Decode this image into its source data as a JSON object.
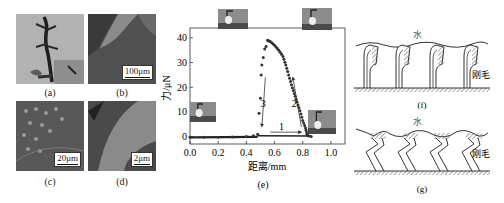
{
  "panels": {
    "a": {
      "caption": "(a)",
      "subject": "gecko-photo"
    },
    "b": {
      "caption": "(b)",
      "scale": "100μm"
    },
    "c": {
      "caption": "(c)",
      "scale": "20μm"
    },
    "d": {
      "caption": "(d)",
      "scale": "2μm"
    },
    "e": {
      "caption": "(e)"
    },
    "f": {
      "caption": "(f)",
      "water_label": "水",
      "bristle_label": "刚毛"
    },
    "g": {
      "caption": "(g)",
      "water_label": "水",
      "bristle_label": "刚毛"
    }
  },
  "colors": {
    "data_points": "#333333",
    "photo_light": "#9a9a9a",
    "photo_dark": "#3a3a3a",
    "hatch": "#555555"
  },
  "chart_data": {
    "type": "scatter",
    "title": "",
    "xlabel": "距离/mm",
    "ylabel": "力/μN",
    "xlim": [
      0.0,
      1.1
    ],
    "ylim": [
      -3,
      44
    ],
    "xticks": [
      "0.0",
      "0.2",
      "0.4",
      "0.6",
      "0.8",
      "1.0"
    ],
    "yticks": [
      "0",
      "10",
      "20",
      "30",
      "40"
    ],
    "grid": false,
    "annotations": [
      {
        "label": "1",
        "x": 0.65,
        "y": 2.5,
        "arrow": "right"
      },
      {
        "label": "2",
        "x": 0.74,
        "y": 12,
        "arrow": "up-left"
      },
      {
        "label": "3",
        "x": 0.52,
        "y": 12,
        "arrow": "down"
      }
    ],
    "series": [
      {
        "name": "force-distance",
        "x": [
          0.0,
          0.1,
          0.2,
          0.3,
          0.4,
          0.45,
          0.48,
          0.49,
          0.5,
          0.505,
          0.51,
          0.52,
          0.53,
          0.54,
          0.55,
          0.57,
          0.6,
          0.63,
          0.66,
          0.68,
          0.7,
          0.72,
          0.74,
          0.76,
          0.78,
          0.8,
          0.82,
          0.83,
          0.84,
          0.86
        ],
        "y": [
          -0.3,
          -0.3,
          -0.3,
          -0.2,
          0.0,
          0.3,
          1.0,
          9.5,
          15.5,
          25.0,
          29.0,
          32.0,
          35.5,
          36.5,
          39.0,
          38.5,
          37.0,
          35.0,
          32.5,
          29.0,
          25.0,
          21.0,
          17.5,
          14.0,
          10.5,
          6.5,
          3.5,
          1.0,
          0.2,
          0.0
        ]
      }
    ],
    "insets": [
      "droplet-contact-photo",
      "droplet-max-force-photo",
      "droplet-peak-photo",
      "droplet-detach-photo"
    ]
  }
}
